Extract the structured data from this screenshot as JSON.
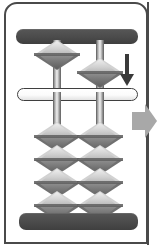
{
  "figure": {
    "name": "abacus-soroban-diagram",
    "frame_color": "#4a4a4a",
    "background_color": "#ffffff"
  },
  "rails": {
    "top": {
      "label": "top-rail",
      "color": "#4b4b4b"
    },
    "bottom": {
      "label": "bottom-rail",
      "color": "#4b4b4b"
    }
  },
  "reckoning_bar": {
    "label": "reckoning-bar",
    "color": "#ffffff",
    "border_color": "#3f3f3f",
    "unit_dot_color": "#2b2b2b"
  },
  "rods": [
    {
      "id": "rod-left",
      "position": "left"
    },
    {
      "id": "rod-right",
      "position": "right"
    }
  ],
  "beads": {
    "bead_light_color": "#d2d2d2",
    "bead_dark_color": "#707070",
    "upper": [
      {
        "rod": "left",
        "state": "raised",
        "value": 0
      },
      {
        "rod": "right",
        "state": "lowered",
        "value": 5
      }
    ],
    "lower_left": [
      {
        "index": 1,
        "state": "raised"
      },
      {
        "index": 2,
        "state": "raised"
      },
      {
        "index": 3,
        "state": "raised"
      },
      {
        "index": 4,
        "state": "raised"
      }
    ],
    "lower_right": [
      {
        "index": 1,
        "state": "raised"
      },
      {
        "index": 2,
        "state": "raised"
      },
      {
        "index": 3,
        "state": "raised"
      },
      {
        "index": 4,
        "state": "raised"
      }
    ]
  },
  "annotations": {
    "down_arrow": {
      "name": "down-arrow",
      "direction": "down",
      "color": "#3a3a3a"
    },
    "right_arrow": {
      "name": "right-arrow",
      "direction": "right",
      "color": "#a8a8a8"
    }
  }
}
